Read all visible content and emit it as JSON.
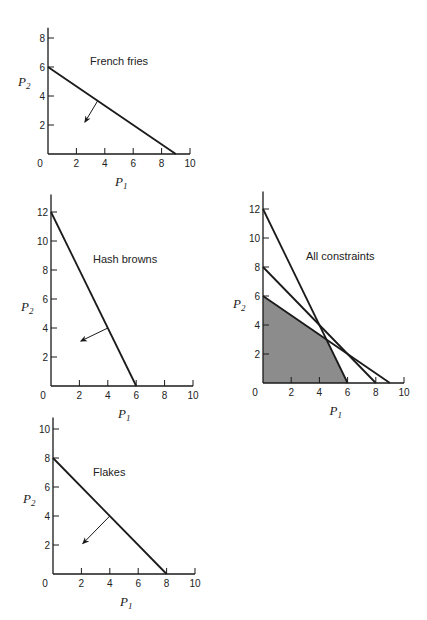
{
  "chart_data": [
    {
      "id": "french-fries",
      "type": "line",
      "title": "French fries",
      "xlabel": "P1",
      "ylabel": "P2",
      "x_ticks": [
        0,
        2,
        4,
        6,
        8,
        10
      ],
      "y_ticks": [
        2,
        4,
        6,
        8
      ],
      "xlim": [
        0,
        10
      ],
      "ylim": [
        0,
        8.7
      ],
      "constraints": [
        {
          "name": "French fries",
          "points": [
            [
              0,
              6
            ],
            [
              9,
              0
            ]
          ]
        }
      ],
      "feasible_arrow": {
        "from": [
          3.5,
          3.67
        ],
        "to": [
          2.6,
          2.2
        ]
      },
      "grid": false,
      "layout": {
        "origin": [
          48,
          154
        ],
        "sx": 14.2,
        "sy": 14.5,
        "title_pos": [
          90,
          65
        ]
      }
    },
    {
      "id": "hash-browns",
      "type": "line",
      "title": "Hash browns",
      "xlabel": "P1",
      "ylabel": "P2",
      "x_ticks": [
        0,
        2,
        4,
        6,
        8,
        10
      ],
      "y_ticks": [
        2,
        4,
        6,
        8,
        10,
        12
      ],
      "xlim": [
        0,
        10
      ],
      "ylim": [
        0,
        13.2
      ],
      "constraints": [
        {
          "name": "Hash browns",
          "points": [
            [
              0,
              12
            ],
            [
              6,
              0
            ]
          ]
        }
      ],
      "feasible_arrow": {
        "from": [
          4,
          4
        ],
        "to": [
          2.1,
          3.1
        ]
      },
      "grid": false,
      "layout": {
        "origin": [
          51,
          386
        ],
        "sx": 14.2,
        "sy": 14.5,
        "title_pos": [
          93,
          263
        ]
      }
    },
    {
      "id": "all-constraints",
      "type": "area",
      "title": "All constraints",
      "xlabel": "P1",
      "ylabel": "P2",
      "x_ticks": [
        0,
        2,
        4,
        6,
        8,
        10
      ],
      "y_ticks": [
        2,
        4,
        6,
        8,
        10,
        12
      ],
      "xlim": [
        0,
        10
      ],
      "ylim": [
        0,
        13.2
      ],
      "constraints": [
        {
          "name": "Hash browns",
          "points": [
            [
              0,
              12
            ],
            [
              6,
              0
            ]
          ]
        },
        {
          "name": "Flakes",
          "points": [
            [
              0,
              8
            ],
            [
              8,
              0
            ]
          ]
        },
        {
          "name": "French fries",
          "points": [
            [
              0,
              6
            ],
            [
              9,
              0
            ]
          ]
        }
      ],
      "feasible_region": [
        [
          0,
          0
        ],
        [
          0,
          6
        ],
        [
          4.5,
          3
        ],
        [
          6,
          0
        ]
      ],
      "feasible_color": "#8c8c8c",
      "grid": false,
      "layout": {
        "origin": [
          263,
          383
        ],
        "sx": 14.1,
        "sy": 14.5,
        "title_pos": [
          306,
          260
        ]
      }
    },
    {
      "id": "flakes",
      "type": "line",
      "title": "Flakes",
      "xlabel": "P1",
      "ylabel": "P2",
      "x_ticks": [
        0,
        2,
        4,
        6,
        8,
        10
      ],
      "y_ticks": [
        2,
        4,
        6,
        8,
        10
      ],
      "xlim": [
        0,
        10
      ],
      "ylim": [
        0,
        10.8
      ],
      "constraints": [
        {
          "name": "Flakes",
          "points": [
            [
              0,
              8
            ],
            [
              8,
              0
            ]
          ]
        }
      ],
      "feasible_arrow": {
        "from": [
          4,
          4
        ],
        "to": [
          2.1,
          2.1
        ]
      },
      "grid": false,
      "layout": {
        "origin": [
          53,
          574
        ],
        "sx": 14.2,
        "sy": 14.5,
        "title_pos": [
          93,
          476
        ]
      }
    }
  ],
  "colors": {
    "ink": "#1a1a1a",
    "background": "#ffffff"
  }
}
